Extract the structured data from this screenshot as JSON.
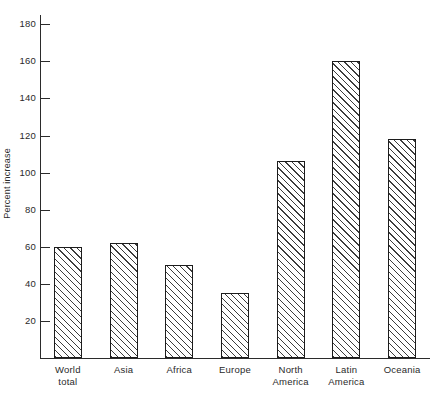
{
  "chart_data": {
    "type": "bar",
    "title": "",
    "subtitle": "",
    "xlabel": "",
    "ylabel": "Percent increase",
    "categories": [
      "World total",
      "Asia",
      "Africa",
      "Europe",
      "North America",
      "Latin America",
      "Oceania"
    ],
    "category_lines": [
      [
        "World",
        "total"
      ],
      [
        "Asia"
      ],
      [
        "Africa"
      ],
      [
        "Europe"
      ],
      [
        "North",
        "America"
      ],
      [
        "Latin",
        "America"
      ],
      [
        "Oceania"
      ]
    ],
    "values": [
      60,
      62,
      50,
      35,
      106,
      160,
      118
    ],
    "ylim": [
      0,
      185
    ],
    "yticks": [
      20,
      40,
      60,
      80,
      100,
      120,
      140,
      160,
      180
    ],
    "ytick_labels": [
      "20",
      "40",
      "60",
      "80",
      "100",
      "120",
      "140",
      "160",
      "180"
    ],
    "grid": false,
    "legend": false,
    "bar_style": {
      "fill": "diagonal-hatch",
      "hatch_color": "#3c3c3c",
      "edge_color": "#1c1c1c",
      "background": "#ffffff"
    },
    "axis_color": "#2b2b2b",
    "text_color": "#2a2a2a"
  }
}
